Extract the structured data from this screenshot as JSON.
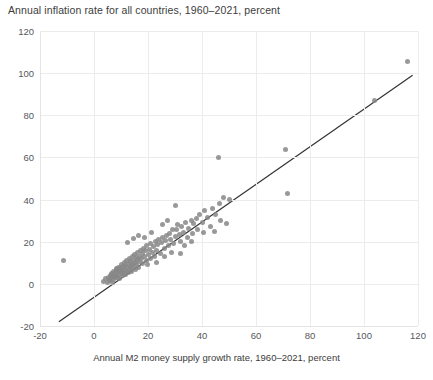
{
  "chart_data": {
    "type": "scatter",
    "title": "Annual inflation rate for all countries, 1960–2021, percent",
    "xlabel": "Annual M2 money supply growth rate, 1960–2021, percent",
    "ylabel": "",
    "xlim": [
      -20,
      120
    ],
    "ylim": [
      -20,
      120
    ],
    "xticks": [
      -20,
      0,
      20,
      40,
      60,
      80,
      100,
      120
    ],
    "yticks": [
      -20,
      0,
      20,
      40,
      60,
      80,
      100,
      120
    ],
    "xtick_labels": [
      "-20",
      "0",
      "20",
      "40",
      "60",
      "80",
      "100",
      "120"
    ],
    "ytick_labels": [
      "-20",
      "0",
      "20",
      "40",
      "60",
      "80",
      "100",
      "120"
    ],
    "grid": true,
    "legend": null,
    "marker_color": "#878787",
    "marker_size": 5,
    "line_color": "#333333",
    "trendline": {
      "label": "linear fit",
      "x": [
        -13,
        118
      ],
      "y": [
        -18,
        99
      ]
    },
    "points": [
      [
        -11.2,
        11.0
      ],
      [
        3.5,
        1.0
      ],
      [
        4.2,
        2.6
      ],
      [
        5.0,
        0.5
      ],
      [
        5.3,
        3.0
      ],
      [
        5.8,
        1.8
      ],
      [
        6.0,
        4.0
      ],
      [
        6.2,
        2.2
      ],
      [
        6.4,
        5.0
      ],
      [
        6.6,
        3.4
      ],
      [
        6.8,
        0.8
      ],
      [
        7.0,
        4.4
      ],
      [
        7.2,
        2.0
      ],
      [
        7.4,
        6.0
      ],
      [
        7.6,
        3.6
      ],
      [
        7.8,
        5.4
      ],
      [
        8.0,
        2.8
      ],
      [
        8.2,
        6.6
      ],
      [
        8.4,
        4.2
      ],
      [
        8.5,
        7.2
      ],
      [
        8.7,
        3.0
      ],
      [
        8.9,
        5.8
      ],
      [
        9.0,
        8.0
      ],
      [
        9.2,
        4.6
      ],
      [
        9.4,
        6.2
      ],
      [
        9.6,
        2.4
      ],
      [
        9.8,
        7.6
      ],
      [
        10.0,
        5.0
      ],
      [
        10.2,
        9.0
      ],
      [
        10.4,
        6.4
      ],
      [
        10.6,
        3.8
      ],
      [
        10.8,
        8.4
      ],
      [
        11.0,
        5.6
      ],
      [
        11.2,
        10.0
      ],
      [
        11.4,
        7.0
      ],
      [
        11.6,
        4.4
      ],
      [
        11.8,
        8.8
      ],
      [
        12.0,
        6.0
      ],
      [
        12.2,
        11.0
      ],
      [
        12.4,
        7.8
      ],
      [
        12.6,
        5.2
      ],
      [
        12.8,
        9.6
      ],
      [
        13.0,
        6.8
      ],
      [
        13.2,
        12.0
      ],
      [
        13.4,
        8.2
      ],
      [
        13.6,
        10.4
      ],
      [
        13.8,
        5.8
      ],
      [
        14.0,
        9.0
      ],
      [
        14.2,
        13.0
      ],
      [
        14.4,
        7.4
      ],
      [
        14.6,
        11.2
      ],
      [
        14.8,
        8.6
      ],
      [
        15.0,
        14.0
      ],
      [
        15.2,
        10.0
      ],
      [
        15.4,
        6.6
      ],
      [
        15.6,
        12.4
      ],
      [
        15.8,
        9.4
      ],
      [
        16.0,
        15.0
      ],
      [
        16.2,
        11.6
      ],
      [
        16.5,
        8.0
      ],
      [
        16.8,
        13.2
      ],
      [
        17.0,
        10.6
      ],
      [
        17.2,
        16.0
      ],
      [
        17.5,
        12.0
      ],
      [
        17.8,
        14.4
      ],
      [
        18.0,
        9.8
      ],
      [
        18.3,
        17.0
      ],
      [
        18.6,
        13.0
      ],
      [
        19.0,
        15.6
      ],
      [
        19.3,
        11.0
      ],
      [
        19.6,
        18.0
      ],
      [
        20.0,
        14.0
      ],
      [
        20.4,
        16.4
      ],
      [
        20.8,
        12.2
      ],
      [
        21.0,
        19.0
      ],
      [
        21.5,
        15.0
      ],
      [
        22.0,
        17.6
      ],
      [
        22.4,
        13.0
      ],
      [
        22.8,
        20.0
      ],
      [
        23.2,
        16.0
      ],
      [
        23.6,
        18.6
      ],
      [
        24.0,
        21.0
      ],
      [
        24.5,
        14.6
      ],
      [
        25.0,
        19.4
      ],
      [
        25.5,
        22.0
      ],
      [
        26.0,
        17.0
      ],
      [
        26.5,
        20.4
      ],
      [
        27.0,
        23.0
      ],
      [
        27.5,
        18.2
      ],
      [
        28.0,
        24.0
      ],
      [
        28.5,
        21.0
      ],
      [
        29.0,
        25.6
      ],
      [
        29.5,
        19.0
      ],
      [
        30.0,
        22.6
      ],
      [
        30.5,
        26.0
      ],
      [
        31.0,
        28.0
      ],
      [
        31.5,
        23.4
      ],
      [
        32.0,
        20.0
      ],
      [
        32.5,
        27.0
      ],
      [
        33.0,
        24.4
      ],
      [
        34.0,
        29.0
      ],
      [
        34.5,
        22.0
      ],
      [
        35.0,
        26.2
      ],
      [
        36.0,
        30.0
      ],
      [
        36.5,
        24.0
      ],
      [
        37.0,
        28.6
      ],
      [
        38.0,
        31.0
      ],
      [
        38.5,
        26.0
      ],
      [
        39.0,
        33.0
      ],
      [
        40.0,
        29.0
      ],
      [
        40.5,
        24.6
      ],
      [
        41.0,
        35.0
      ],
      [
        42.0,
        31.6
      ],
      [
        43.0,
        27.0
      ],
      [
        44.0,
        36.0
      ],
      [
        45.0,
        33.0
      ],
      [
        46.0,
        60.0
      ],
      [
        46.5,
        38.0
      ],
      [
        47.0,
        30.0
      ],
      [
        48.0,
        41.0
      ],
      [
        49.0,
        28.6
      ],
      [
        50.0,
        40.0
      ],
      [
        12.5,
        19.6
      ],
      [
        14.5,
        21.6
      ],
      [
        16.6,
        23.0
      ],
      [
        19.8,
        9.0
      ],
      [
        23.0,
        10.0
      ],
      [
        26.2,
        13.0
      ],
      [
        28.8,
        15.0
      ],
      [
        33.5,
        18.0
      ],
      [
        36.2,
        20.0
      ],
      [
        30.2,
        37.0
      ],
      [
        32.2,
        14.6
      ],
      [
        25.2,
        28.0
      ],
      [
        27.2,
        30.0
      ],
      [
        21.2,
        24.4
      ],
      [
        18.8,
        22.0
      ],
      [
        44.5,
        25.0
      ],
      [
        71.0,
        64.0
      ],
      [
        71.5,
        43.0
      ],
      [
        104.0,
        87.0
      ],
      [
        116.0,
        105.5
      ]
    ]
  }
}
